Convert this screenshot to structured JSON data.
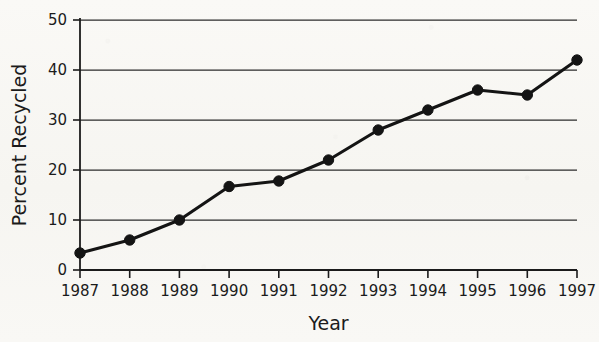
{
  "chart_data": {
    "type": "line",
    "title": "",
    "xlabel": "Year",
    "ylabel": "Percent Recycled",
    "categories": [
      "1987",
      "1988",
      "1989",
      "1990",
      "1991",
      "1992",
      "1993",
      "1994",
      "1995",
      "1996",
      "1997"
    ],
    "x": [
      1987,
      1988,
      1989,
      1990,
      1991,
      1992,
      1993,
      1994,
      1995,
      1996,
      1997
    ],
    "values": [
      3.4,
      6.0,
      10.0,
      16.7,
      17.8,
      22.0,
      28.0,
      32.0,
      36.0,
      35.0,
      42.0
    ],
    "series": [
      {
        "name": "Percent Recycled",
        "values": [
          3.4,
          6.0,
          10.0,
          16.7,
          17.8,
          22.0,
          28.0,
          32.0,
          36.0,
          35.0,
          42.0
        ]
      }
    ],
    "ylim": [
      0,
      50
    ],
    "yticks": [
      0,
      10,
      20,
      30,
      40,
      50
    ],
    "ytick_labels": [
      "0",
      "10",
      "20",
      "30",
      "40",
      "50"
    ],
    "xtick_labels": [
      "1987",
      "1988",
      "1989",
      "1990",
      "1991",
      "1992",
      "1993",
      "1994",
      "1995",
      "1996",
      "1997"
    ],
    "grid": true,
    "grid_axis": "y",
    "legend": false,
    "legend_position": "none",
    "marker": "filled-circle",
    "line_color": "#141414",
    "marker_color": "#141414",
    "grid_color": "#2b2b2b",
    "axis_color": "#1b1b1b",
    "background_color": "#f8f7f4"
  },
  "labels": {
    "y_axis_title": "Percent Recycled",
    "x_axis_title": "Year"
  }
}
